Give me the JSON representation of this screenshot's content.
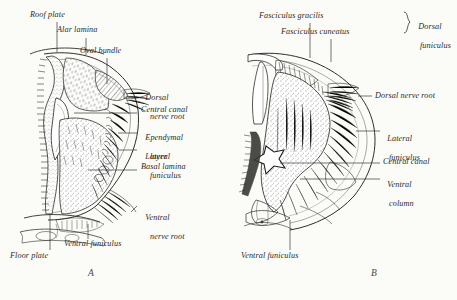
{
  "figure": {
    "title_visible": false,
    "style": "antique monochrome engraving, stippled line art",
    "background_color": "#fbfbf8",
    "ink_color": "#2a2a28"
  },
  "panels": [
    {
      "id": "A",
      "letter": "A",
      "caption_position": {
        "x": 88,
        "y": 268
      },
      "description": "Embryonic spinal cord half cross-section",
      "labels": [
        {
          "name": "roof-plate",
          "text": "Roof plate",
          "x": 30,
          "y": 14,
          "align": "left",
          "leader": {
            "x1": 57,
            "y1": 25,
            "x2": 57,
            "y2": 50
          }
        },
        {
          "name": "alar-lamina",
          "text": "Alar lamina",
          "x": 57,
          "y": 28,
          "align": "left",
          "leader": {
            "x1": 86,
            "y1": 39,
            "x2": 86,
            "y2": 52
          }
        },
        {
          "name": "oval-bundle",
          "text": "Oval bundle",
          "x": 80,
          "y": 49,
          "align": "left",
          "leader": {
            "x1": 107,
            "y1": 59,
            "x2": 107,
            "y2": 84
          }
        },
        {
          "name": "dorsal-nerve-root",
          "text": "Dorsal",
          "text2": "nerve root",
          "x": 140,
          "y": 86,
          "align": "left",
          "leader": {
            "x1": 128,
            "y1": 97,
            "x2": 138,
            "y2": 97
          }
        },
        {
          "name": "central-canal",
          "text": "Central canal",
          "x": 140,
          "y": 107,
          "align": "left",
          "leader": {
            "x1": 100,
            "y1": 113,
            "x2": 138,
            "y2": 113
          }
        },
        {
          "name": "ependymal-layer",
          "text": "Ependymal",
          "text2": "layer",
          "x": 140,
          "y": 126,
          "align": "left",
          "leader": {
            "x1": 122,
            "y1": 133,
            "x2": 138,
            "y2": 133
          }
        },
        {
          "name": "lateral-funiculus",
          "text": "Lateral",
          "text2": "funiculus",
          "x": 140,
          "y": 145,
          "align": "left",
          "leader": {
            "x1": 127,
            "y1": 150,
            "x2": 138,
            "y2": 150
          }
        },
        {
          "name": "basal-lamina",
          "text": "Basal lamina",
          "x": 140,
          "y": 164,
          "align": "left",
          "leader": {
            "x1": 92,
            "y1": 170,
            "x2": 138,
            "y2": 170
          }
        },
        {
          "name": "ventral-nerve-root",
          "text": "Ventral",
          "text2": "nerve root",
          "x": 140,
          "y": 206,
          "align": "left",
          "leader": {
            "x1": 128,
            "y1": 214,
            "x2": 138,
            "y2": 214
          }
        },
        {
          "name": "ventral-funiculus",
          "text": "Ventral funiculus",
          "x": 65,
          "y": 241,
          "align": "left",
          "leader": {
            "x1": 88,
            "y1": 225,
            "x2": 88,
            "y2": 240
          }
        },
        {
          "name": "floor-plate",
          "text": "Floor plate",
          "x": 12,
          "y": 253,
          "align": "left",
          "leader": {
            "x1": 50,
            "y1": 216,
            "x2": 50,
            "y2": 251
          }
        }
      ]
    },
    {
      "id": "B",
      "letter": "B",
      "caption_position": {
        "x": 371,
        "y": 268
      },
      "description": "Mature spinal cord half cross-section",
      "bracket": {
        "name": "dorsal-funiculus-bracket",
        "x": 404,
        "y": 12,
        "height": 22
      },
      "labels": [
        {
          "name": "fasciculus-gracilis",
          "text": "Fasciculus gracilis",
          "x": 260,
          "y": 14,
          "align": "left",
          "leader": {
            "x1": 310,
            "y1": 25,
            "x2": 310,
            "y2": 56
          }
        },
        {
          "name": "fasciculus-cuneatus",
          "text": "Fasciculus cuneatus",
          "x": 281,
          "y": 30,
          "align": "left",
          "leader": {
            "x1": 331,
            "y1": 41,
            "x2": 331,
            "y2": 60
          }
        },
        {
          "name": "dorsal-funiculus",
          "text": "Dorsal",
          "text2": "funiculus",
          "x": 414,
          "y": 15,
          "align": "left"
        },
        {
          "name": "dorsal-nerve-root-b",
          "text": "Dorsal nerve root",
          "x": 374,
          "y": 92,
          "align": "left",
          "leader": {
            "x1": 356,
            "y1": 96,
            "x2": 372,
            "y2": 96
          }
        },
        {
          "name": "lateral-funiculus-b",
          "text": "Lateral",
          "text2": "funiculus",
          "x": 382,
          "y": 126,
          "align": "left",
          "leader": {
            "x1": 366,
            "y1": 131,
            "x2": 380,
            "y2": 131
          }
        },
        {
          "name": "central-canal-b",
          "text": "Central canal",
          "x": 382,
          "y": 158,
          "align": "left",
          "leader": {
            "x1": 288,
            "y1": 163,
            "x2": 380,
            "y2": 163
          }
        },
        {
          "name": "ventral-column",
          "text": "Ventral",
          "text2": "column",
          "x": 382,
          "y": 173,
          "align": "left",
          "leader": {
            "x1": 318,
            "y1": 179,
            "x2": 380,
            "y2": 179
          }
        },
        {
          "name": "ventral-funiculus-b",
          "text": "Ventral funiculus",
          "x": 242,
          "y": 253,
          "align": "left",
          "leader": {
            "x1": 290,
            "y1": 222,
            "x2": 290,
            "y2": 251
          }
        }
      ]
    }
  ]
}
